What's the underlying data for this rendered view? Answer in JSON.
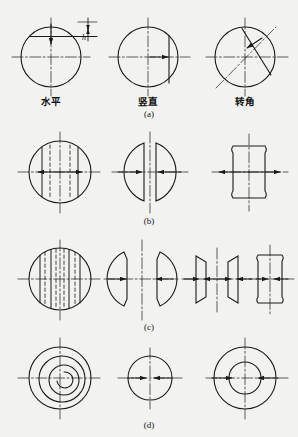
{
  "figure": {
    "title": "",
    "background_color": "#f2f2f0",
    "line_color": "#1a1a1a",
    "rows": [
      {
        "id": "a",
        "caption": "(a)",
        "items": [
          {
            "label": "水平",
            "shape": "circle-with-horizontal-chord",
            "arrow": "down",
            "dimension_label": "h"
          },
          {
            "label": "竖直",
            "shape": "circle-with-vertical-chord",
            "arrow": "right",
            "dimension_label": ""
          },
          {
            "label": "转角",
            "shape": "circle-with-diagonal-chord",
            "arrow": "up-left",
            "dimension_label": ""
          }
        ]
      },
      {
        "id": "b",
        "caption": "(b)",
        "items": [
          {
            "label": "",
            "shape": "circle-with-two-chords-and-dashed-lines",
            "arrow": "outward-horizontal",
            "dimension_label": ""
          },
          {
            "label": "",
            "shape": "two-half-discs-facing",
            "arrow": "inward-horizontal",
            "dimension_label": ""
          },
          {
            "label": "",
            "shape": "vertical-capsule",
            "arrow": "outward-horizontal",
            "dimension_label": ""
          }
        ]
      },
      {
        "id": "c",
        "caption": "(c)",
        "items": [
          {
            "label": "",
            "shape": "circle-with-four-chords-and-dashed-lines",
            "arrow": "outward-horizontal",
            "dimension_label": ""
          },
          {
            "label": "",
            "shape": "two-lens-segments-facing",
            "arrow": "inward-horizontal",
            "dimension_label": ""
          },
          {
            "label": "",
            "shape": "two-trapezoid-segments",
            "arrow": "both-horizontal",
            "dimension_label": ""
          },
          {
            "label": "",
            "shape": "vertical-capsule-narrow",
            "arrow": "inward-horizontal",
            "dimension_label": ""
          }
        ]
      },
      {
        "id": "d",
        "caption": "(d)",
        "items": [
          {
            "label": "",
            "shape": "concentric-spiral-circles",
            "arrow": "none",
            "dimension_label": ""
          },
          {
            "label": "",
            "shape": "single-circle",
            "arrow": "inward-horizontal",
            "dimension_label": ""
          },
          {
            "label": "",
            "shape": "two-concentric-circles",
            "arrow": "inward-horizontal",
            "dimension_label": ""
          }
        ]
      }
    ]
  }
}
